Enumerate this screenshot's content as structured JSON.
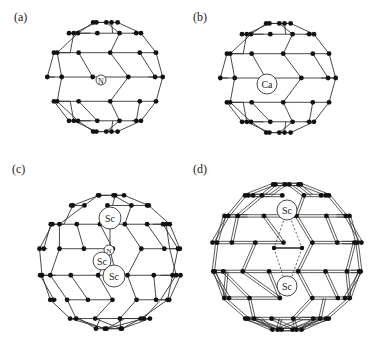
{
  "figure": {
    "panels": [
      {
        "id": "a",
        "label": "(a)",
        "encapsulated": [
          "N"
        ],
        "description": "N@C60 fullerene cage"
      },
      {
        "id": "b",
        "label": "(b)",
        "encapsulated": [
          "Ca"
        ],
        "description": "Ca@C60 fullerene cage"
      },
      {
        "id": "c",
        "label": "(c)",
        "encapsulated": [
          "Sc",
          "N",
          "Sc",
          "Sc"
        ],
        "description": "Sc3N@C80 fullerene cage"
      },
      {
        "id": "d",
        "label": "(d)",
        "encapsulated": [
          "Sc",
          "Sc"
        ],
        "description": "Sc2C2 endohedral fullerene cage"
      }
    ]
  }
}
